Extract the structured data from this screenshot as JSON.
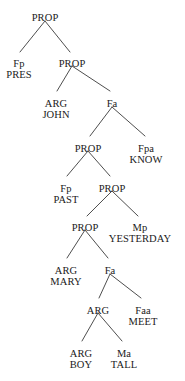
{
  "figure": {
    "type": "constituency-syntax-tree",
    "width": 185,
    "height": 381,
    "background_color": "#ffffff",
    "line_color": "#3a3a3a",
    "text_color": "#1a1a1a"
  },
  "nodes": [
    {
      "id": "n0",
      "category": "PROP",
      "word": "",
      "x": 45,
      "y": 12
    },
    {
      "id": "n1",
      "category": "Fp",
      "word": "PRES",
      "x": 19,
      "y": 58
    },
    {
      "id": "n2",
      "category": "PROP",
      "word": "",
      "x": 72,
      "y": 58
    },
    {
      "id": "n3",
      "category": "ARG",
      "word": "JOHN",
      "x": 56,
      "y": 98
    },
    {
      "id": "n4",
      "category": "Fa",
      "word": "",
      "x": 112,
      "y": 98
    },
    {
      "id": "n5",
      "category": "PROP",
      "word": "",
      "x": 88,
      "y": 143
    },
    {
      "id": "n6",
      "category": "Fpa",
      "word": "KNOW",
      "x": 146,
      "y": 143
    },
    {
      "id": "n7",
      "category": "Fp",
      "word": "PAST",
      "x": 66,
      "y": 183
    },
    {
      "id": "n8",
      "category": "PROP",
      "word": "",
      "x": 112,
      "y": 183
    },
    {
      "id": "n9",
      "category": "PROP",
      "word": "",
      "x": 85,
      "y": 222
    },
    {
      "id": "n10",
      "category": "Mp",
      "word": "YESTERDAY",
      "x": 140,
      "y": 222
    },
    {
      "id": "n11",
      "category": "ARG",
      "word": "MARY",
      "x": 66,
      "y": 265
    },
    {
      "id": "n12",
      "category": "Fa",
      "word": "",
      "x": 110,
      "y": 265
    },
    {
      "id": "n13",
      "category": "ARG",
      "word": "",
      "x": 98,
      "y": 305
    },
    {
      "id": "n14",
      "category": "Faa",
      "word": "MEET",
      "x": 143,
      "y": 305
    },
    {
      "id": "n15",
      "category": "ARG",
      "word": "BOY",
      "x": 81,
      "y": 348
    },
    {
      "id": "n16",
      "category": "Ma",
      "word": "TALL",
      "x": 124,
      "y": 348
    }
  ],
  "edges": [
    {
      "from": "n0",
      "to": "n1",
      "x1": 45,
      "y1": 21,
      "x2": 20,
      "y2": 52
    },
    {
      "from": "n0",
      "to": "n2",
      "x1": 45,
      "y1": 21,
      "x2": 70,
      "y2": 52
    },
    {
      "from": "n2",
      "to": "n3",
      "x1": 72,
      "y1": 66,
      "x2": 57,
      "y2": 91
    },
    {
      "from": "n2",
      "to": "n4",
      "x1": 72,
      "y1": 66,
      "x2": 110,
      "y2": 91
    },
    {
      "from": "n4",
      "to": "n5",
      "x1": 112,
      "y1": 107,
      "x2": 90,
      "y2": 136
    },
    {
      "from": "n4",
      "to": "n6",
      "x1": 112,
      "y1": 107,
      "x2": 145,
      "y2": 136
    },
    {
      "from": "n5",
      "to": "n7",
      "x1": 88,
      "y1": 151,
      "x2": 67,
      "y2": 176
    },
    {
      "from": "n5",
      "to": "n8",
      "x1": 88,
      "y1": 151,
      "x2": 110,
      "y2": 176
    },
    {
      "from": "n8",
      "to": "n9",
      "x1": 112,
      "y1": 191,
      "x2": 87,
      "y2": 216
    },
    {
      "from": "n8",
      "to": "n10",
      "x1": 112,
      "y1": 191,
      "x2": 138,
      "y2": 216
    },
    {
      "from": "n9",
      "to": "n11",
      "x1": 85,
      "y1": 230,
      "x2": 67,
      "y2": 258
    },
    {
      "from": "n9",
      "to": "n12",
      "x1": 85,
      "y1": 230,
      "x2": 108,
      "y2": 258
    },
    {
      "from": "n12",
      "to": "n13",
      "x1": 110,
      "y1": 274,
      "x2": 99,
      "y2": 298
    },
    {
      "from": "n12",
      "to": "n14",
      "x1": 110,
      "y1": 274,
      "x2": 141,
      "y2": 298
    },
    {
      "from": "n13",
      "to": "n15",
      "x1": 98,
      "y1": 313,
      "x2": 82,
      "y2": 341
    },
    {
      "from": "n13",
      "to": "n16",
      "x1": 98,
      "y1": 313,
      "x2": 122,
      "y2": 341
    }
  ]
}
